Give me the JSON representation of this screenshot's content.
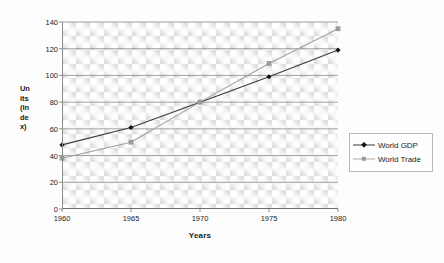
{
  "chart_data": {
    "type": "line",
    "title": "",
    "xlabel": "Years",
    "ylabel_lines": [
      "Un",
      "its",
      "(In",
      "de",
      "x)"
    ],
    "ylabel": "Units (Index)",
    "categories": [
      1960,
      1965,
      1970,
      1975,
      1980
    ],
    "x_tick_labels": [
      "1960",
      "1965",
      "1970",
      "1975",
      "1980"
    ],
    "y_tick_labels": [
      "0",
      "20",
      "40",
      "60",
      "80",
      "100",
      "120",
      "140"
    ],
    "y_ticks": [
      0,
      20,
      40,
      60,
      80,
      100,
      120,
      140
    ],
    "ylim": [
      0,
      140
    ],
    "xlim": [
      1960,
      1980
    ],
    "grid": "horizontal",
    "legend_position": "right",
    "series": [
      {
        "name": "World GDP",
        "values": [
          48,
          61,
          80,
          99,
          119
        ],
        "color": "#3a3a3a",
        "marker": "diamond",
        "marker_color": "#121212"
      },
      {
        "name": "World Trade",
        "values": [
          38,
          50,
          80,
          109,
          135
        ],
        "color": "#a0a0a0",
        "marker": "square",
        "marker_color": "#9a9a9a"
      }
    ]
  },
  "legend": {
    "items": [
      {
        "label": "World GDP"
      },
      {
        "label": "World Trade"
      }
    ]
  },
  "colors": {
    "plot_background": "#e9e9e9",
    "gridline": "#8a8a8a",
    "axis": "#6e6e6e",
    "series_gdp": "#3a3a3a",
    "series_trade": "#a0a0a0",
    "text": "#1c1c1c"
  }
}
